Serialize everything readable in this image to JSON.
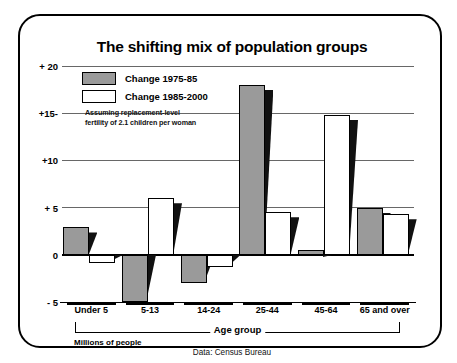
{
  "title": "The shifting mix of population groups",
  "credit": "Robert McAuley—BW",
  "source": "Data: Census Bureau",
  "units_label": "Millions of people",
  "axis_group_label": "Age group",
  "legend": {
    "series1_label": "Change 1975-85",
    "series2_label": "Change 1985-2000",
    "note_line1": "Assuming replacement-level",
    "note_line2": "fertility of 2.1 children per woman"
  },
  "colors": {
    "series1_fill": "#9a9a9a",
    "series2_fill": "#ffffff",
    "outline": "#000000",
    "gridline": "#676767",
    "background": "#ffffff"
  },
  "y_ticks": [
    {
      "label": "+ 20",
      "value": 20
    },
    {
      "label": "+15-",
      "value": 15
    },
    {
      "label": "+10",
      "value": 10
    },
    {
      "label": "+ 5",
      "value": 5
    },
    {
      "label": "0",
      "value": 0
    },
    {
      "label": "- 5",
      "value": -5
    }
  ],
  "chart_data": {
    "type": "bar",
    "title": "The shifting mix of population groups",
    "subtitle": "Assuming replacement-level fertility of 2.1 children per woman",
    "xlabel": "Age group",
    "ylabel": "Millions of people",
    "ylim": [
      -5,
      20
    ],
    "yticks": [
      -5,
      0,
      5,
      10,
      15,
      20
    ],
    "grid": true,
    "legend_position": "top-left",
    "categories": [
      "Under 5",
      "5-13",
      "14-24",
      "25-44",
      "45-64",
      "65 and over"
    ],
    "series": [
      {
        "name": "Change 1975-85",
        "values": [
          2.9,
          -5.0,
          -3.0,
          18.0,
          0.5,
          5.0
        ]
      },
      {
        "name": "Change 1985-2000",
        "values": [
          -0.9,
          6.0,
          -1.3,
          4.5,
          14.8,
          4.3
        ]
      }
    ]
  }
}
